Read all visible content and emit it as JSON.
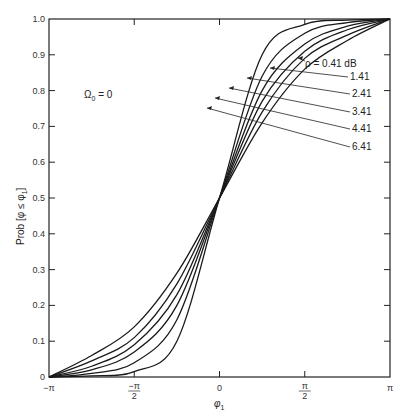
{
  "chart_data": {
    "type": "line",
    "title": "",
    "annotation": "Ω0 = 0",
    "xlabel": "φ1",
    "ylabel": "Prob [φ ≤ φ1]",
    "xlim": [
      -3.14159,
      3.14159
    ],
    "ylim": [
      0,
      1.0
    ],
    "x_ticks": [
      {
        "value": -3.14159,
        "label": "−π"
      },
      {
        "value": -1.5708,
        "label": "−π/2"
      },
      {
        "value": 0,
        "label": "0"
      },
      {
        "value": 1.5708,
        "label": "π/2"
      },
      {
        "value": 3.14159,
        "label": "π"
      }
    ],
    "y_ticks": [
      "0",
      "0.1",
      "0.2",
      "0.3",
      "0.4",
      "0.5",
      "0.6",
      "0.7",
      "0.8",
      "0.9",
      "1.0"
    ],
    "grid": false,
    "legend_position": "inline labels upper right with leader lines",
    "x": [
      -3.14159,
      -2.356,
      -1.5708,
      -0.785,
      0,
      0.785,
      1.5708,
      2.356,
      3.14159
    ],
    "series": [
      {
        "name": "ρ = 0.41 dB",
        "values": [
          0.0,
          0.06,
          0.14,
          0.29,
          0.5,
          0.71,
          0.86,
          0.94,
          1.0
        ]
      },
      {
        "name": "1.41",
        "values": [
          0.0,
          0.045,
          0.11,
          0.26,
          0.5,
          0.74,
          0.89,
          0.955,
          1.0
        ]
      },
      {
        "name": "2.41",
        "values": [
          0.0,
          0.03,
          0.09,
          0.23,
          0.5,
          0.77,
          0.91,
          0.97,
          1.0
        ]
      },
      {
        "name": "3.41",
        "values": [
          0.0,
          0.02,
          0.07,
          0.2,
          0.5,
          0.8,
          0.93,
          0.98,
          1.0
        ]
      },
      {
        "name": "4.41",
        "values": [
          0.0,
          0.01,
          0.04,
          0.16,
          0.5,
          0.84,
          0.96,
          0.99,
          1.0
        ]
      },
      {
        "name": "6.41",
        "values": [
          0.0,
          0.003,
          0.015,
          0.1,
          0.5,
          0.9,
          0.985,
          0.997,
          1.0
        ]
      }
    ]
  },
  "labels": {
    "annotation_omega": "Ω",
    "annotation_sub": "0",
    "annotation_rest": " = 0",
    "ylabel_text": "Prob [φ ≤ φ",
    "ylabel_sub": "1",
    "ylabel_close": "]",
    "xlabel_text": "φ",
    "xlabel_sub": "1",
    "series_labels": [
      "ρ = 0.41 dB",
      "1.41",
      "2.41",
      "3.41",
      "4.41",
      "6.41"
    ]
  }
}
